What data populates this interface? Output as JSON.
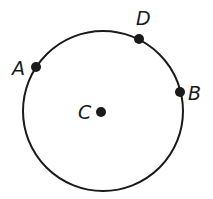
{
  "diagram": {
    "type": "circle-with-points",
    "circle": {
      "cx": 103,
      "cy": 111,
      "r": 80,
      "stroke": "#1a1a1a",
      "stroke_width": 2
    },
    "points": [
      {
        "id": "A",
        "label": "A",
        "x": 36,
        "y": 67,
        "label_x": 12,
        "label_y": 75,
        "on_circle": true
      },
      {
        "id": "D",
        "label": "D",
        "x": 139,
        "y": 39,
        "label_x": 136,
        "label_y": 25,
        "on_circle": true
      },
      {
        "id": "B",
        "label": "B",
        "x": 180,
        "y": 92,
        "label_x": 188,
        "label_y": 100,
        "on_circle": true
      },
      {
        "id": "C",
        "label": "C",
        "x": 101,
        "y": 112,
        "label_x": 78,
        "label_y": 119,
        "on_circle": false,
        "role": "center"
      }
    ],
    "dot_radius": 5,
    "color": "#1a1a1a"
  }
}
